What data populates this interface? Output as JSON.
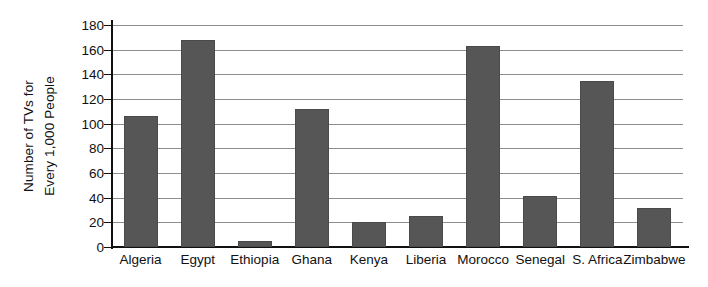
{
  "chart_data": {
    "type": "bar",
    "title": "",
    "xlabel": "",
    "ylabel": "Number of TVs for Every 1,000 People",
    "ylabel_lines": [
      "Number of TVs for",
      "Every 1,000 People"
    ],
    "categories": [
      "Algeria",
      "Egypt",
      "Ethiopia",
      "Ghana",
      "Kenya",
      "Liberia",
      "Morocco",
      "Senegal",
      "S. Africa",
      "Zimbabwe"
    ],
    "values": [
      106,
      168,
      5,
      112,
      20,
      25,
      163,
      41,
      135,
      32
    ],
    "ylim": [
      0,
      180
    ],
    "ytick_step": 20,
    "yticks": [
      0,
      20,
      40,
      60,
      80,
      100,
      120,
      140,
      160,
      180
    ],
    "ytick_labels": [
      "0",
      "20",
      "40",
      "60",
      "80",
      "100",
      "120",
      "140",
      "160",
      "180"
    ],
    "grid": true,
    "legend": false,
    "legend_position": "none",
    "bar_color": "#565656",
    "grid_color": "#8d8d8d",
    "axis_color": "#111111",
    "background_color": "#ffffff"
  }
}
